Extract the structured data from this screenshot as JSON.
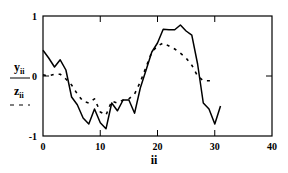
{
  "chart_data": {
    "type": "line",
    "title": "",
    "xlabel": "ii",
    "ylabel_series": [
      "y_ii",
      "z_ii"
    ],
    "xlim": [
      0,
      40
    ],
    "ylim": [
      -1,
      1
    ],
    "x_ticks": [
      0,
      10,
      20,
      30,
      40
    ],
    "y_ticks": [
      -1,
      0,
      1
    ],
    "grid": false,
    "legend_position": "left (as y-axis label stack)",
    "x": [
      0,
      1,
      2,
      3,
      4,
      5,
      6,
      7,
      8,
      9,
      10,
      11,
      12,
      13,
      14,
      15,
      16,
      17,
      18,
      19,
      20,
      21,
      22,
      23,
      24,
      25,
      26,
      27,
      28,
      29,
      30,
      31
    ],
    "series": [
      {
        "name": "y_ii",
        "style": "solid",
        "color": "#000000",
        "values": [
          0.43,
          0.3,
          0.15,
          0.27,
          0.1,
          -0.35,
          -0.48,
          -0.7,
          -0.8,
          -0.55,
          -0.78,
          -0.88,
          -0.45,
          -0.58,
          -0.4,
          -0.4,
          -0.62,
          -0.2,
          0.1,
          0.4,
          0.55,
          0.78,
          0.77,
          0.77,
          0.85,
          0.75,
          0.68,
          0.2,
          -0.45,
          -0.55,
          -0.8,
          -0.5
        ]
      },
      {
        "name": "z_ii",
        "style": "dashed",
        "color": "#000000",
        "values": [
          0.02,
          0.0,
          0.03,
          0.03,
          -0.05,
          -0.15,
          -0.3,
          -0.42,
          -0.45,
          -0.38,
          -0.6,
          -0.65,
          -0.42,
          -0.45,
          -0.4,
          -0.38,
          -0.3,
          -0.1,
          0.15,
          0.4,
          0.5,
          0.55,
          0.5,
          0.45,
          0.38,
          0.3,
          0.18,
          0.0,
          -0.08,
          -0.08,
          -0.08,
          null
        ]
      }
    ]
  },
  "labels": {
    "y_main": "y",
    "y_sub": "ii",
    "z_main": "z",
    "z_sub": "ii",
    "x_axis": "ii",
    "legend_dash": "- -"
  }
}
